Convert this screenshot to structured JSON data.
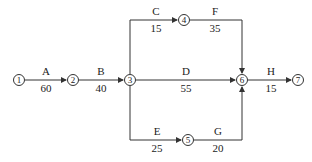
{
  "nodes": [
    {
      "id": "1",
      "label": "1",
      "x": 19,
      "y": 80
    },
    {
      "id": "2",
      "label": "2",
      "x": 73,
      "y": 80
    },
    {
      "id": "3",
      "label": "3",
      "x": 130,
      "y": 80
    },
    {
      "id": "4",
      "label": "4",
      "x": 184,
      "y": 20
    },
    {
      "id": "5",
      "label": "5",
      "x": 188,
      "y": 140
    },
    {
      "id": "6",
      "label": "6",
      "x": 242,
      "y": 80
    },
    {
      "id": "7",
      "label": "7",
      "x": 298,
      "y": 80
    }
  ],
  "activities": [
    {
      "name": "A",
      "duration": "60",
      "from": "1",
      "to": "2"
    },
    {
      "name": "B",
      "duration": "40",
      "from": "2",
      "to": "3"
    },
    {
      "name": "C",
      "duration": "15",
      "from": "3",
      "to": "4"
    },
    {
      "name": "D",
      "duration": "55",
      "from": "3",
      "to": "6"
    },
    {
      "name": "E",
      "duration": "25",
      "from": "3",
      "to": "5"
    },
    {
      "name": "F",
      "duration": "35",
      "from": "4",
      "to": "6"
    },
    {
      "name": "G",
      "duration": "20",
      "from": "5",
      "to": "6"
    },
    {
      "name": "H",
      "duration": "15",
      "from": "6",
      "to": "7"
    }
  ],
  "colors": {
    "line": "#333333",
    "text": "#222222"
  }
}
